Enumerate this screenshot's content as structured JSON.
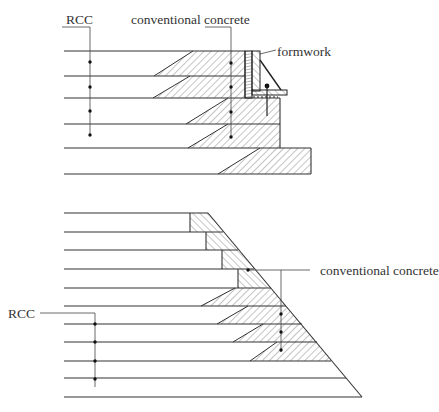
{
  "figure": {
    "top_diagram": {
      "title": "Stepped upstream face with formwork (RCC with conventional concrete facing)",
      "labels": {
        "rcc": "RCC",
        "conventional_concrete": "conventional concrete",
        "formwork": "formwork"
      },
      "lift_lines_y": [
        51,
        76,
        98,
        124,
        148,
        174
      ],
      "rcc_marker_dots": 4,
      "cc_marker_dots": 4
    },
    "bottom_diagram": {
      "title": "Sloped downstream face with conventional concrete facing",
      "labels": {
        "rcc": "RCC",
        "conventional_concrete": "conventional concrete"
      },
      "lift_lines_y": [
        213,
        232,
        250,
        269,
        288,
        306,
        324,
        342,
        361,
        378,
        397
      ],
      "rcc_marker_dots": 4,
      "cc_marker_dots": 4
    },
    "colors": {
      "line": "#333333",
      "hatch": "#555555",
      "background": "#ffffff"
    }
  }
}
